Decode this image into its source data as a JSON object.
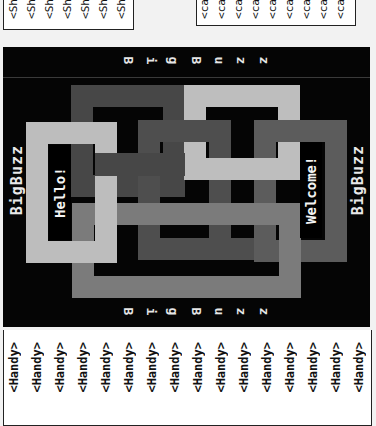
{
  "snippets_top_left": {
    "columns": [
      "<Sh",
      "<Sh",
      "<Sh",
      "<Sh",
      "<Sh",
      "<Sh",
      "<Sh"
    ]
  },
  "snippets_top_right": {
    "columns": [
      "<ca",
      "<ca",
      "<ca",
      "<ca",
      "<ca",
      "<ca",
      "<ca",
      "<ca",
      "<ca"
    ]
  },
  "poster": {
    "top_letters": [
      "B",
      "i",
      "g",
      "B",
      "u",
      "z",
      "z"
    ],
    "bottom_letters": [
      "B",
      "i",
      "g",
      "B",
      "u",
      "z",
      "z"
    ],
    "left_brand": "BigBuzz",
    "right_brand": "BigBuzz",
    "hello_label": "Hello!",
    "welcome_label": "Welcome!",
    "colors": {
      "background": "#050505",
      "light": "#bdbdbd",
      "dark": "#4a4a4a",
      "mid": "#7a7a7a",
      "darkmid": "#5e5e5e"
    }
  },
  "snippets_bottom": {
    "columns": [
      "<Handy>",
      "<Handy>",
      "<Handy>",
      "<Handy>",
      "<Handy>",
      "<Handy>",
      "<Handy>",
      "<Handy>",
      "<Handy>",
      "<Handy>",
      "<Handy>",
      "<Handy>",
      "<Handy>",
      "<Handy>",
      "<Handy>",
      "<Handy>"
    ]
  }
}
